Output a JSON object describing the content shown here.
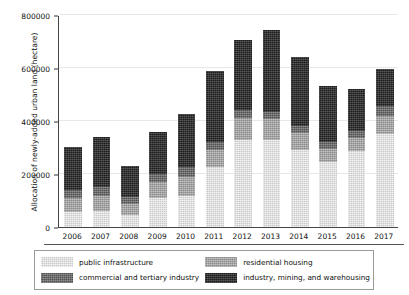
{
  "chart_data": {
    "type": "bar",
    "stacked": true,
    "title": "",
    "xlabel": "",
    "ylabel": "Allocation of newly-added urban land (hectare)",
    "categories": [
      "2006",
      "2007",
      "2008",
      "2009",
      "2010",
      "2011",
      "2012",
      "2013",
      "2014",
      "2015",
      "2016",
      "2017"
    ],
    "ylim": [
      0,
      800000
    ],
    "yticks": [
      0,
      200000,
      400000,
      600000,
      800000
    ],
    "ytick_labels": [
      "0",
      "200000",
      "400000",
      "600000",
      "800000"
    ],
    "grid": true,
    "legend_position": "below-axes",
    "series": [
      {
        "name": "public infrastructure",
        "color": "#c8c8c8",
        "values": [
          57000,
          62000,
          44000,
          110000,
          118000,
          225000,
          330000,
          330000,
          290000,
          245000,
          285000,
          350000
        ]
      },
      {
        "name": "residential housing",
        "color": "#8a8a8a",
        "values": [
          52000,
          55000,
          42000,
          60000,
          72000,
          65000,
          80000,
          77000,
          65000,
          50000,
          50000,
          70000
        ]
      },
      {
        "name": "commercial and tertiary industry",
        "color": "#515151",
        "values": [
          32000,
          35000,
          28000,
          30000,
          38000,
          30000,
          32000,
          28000,
          28000,
          25000,
          28000,
          35000
        ]
      },
      {
        "name": "industry, mining, and warehousing",
        "color": "#1d1d1d",
        "values": [
          160000,
          186000,
          117000,
          157000,
          198000,
          268000,
          265000,
          310000,
          257000,
          213000,
          158000,
          140000
        ]
      }
    ],
    "totals": [
      301000,
      338000,
      231000,
      357000,
      426000,
      588000,
      707000,
      745000,
      640000,
      533000,
      521000,
      595000
    ]
  },
  "legend": {
    "items": [
      {
        "label": "public infrastructure",
        "swatch": "fill-public"
      },
      {
        "label": "residential housing",
        "swatch": "fill-residential"
      },
      {
        "label": "commercial and tertiary industry",
        "swatch": "fill-commercial"
      },
      {
        "label": "industry, mining, and warehousing",
        "swatch": "fill-industry"
      }
    ]
  }
}
